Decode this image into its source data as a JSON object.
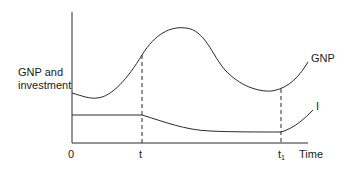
{
  "diagram": {
    "y_axis_label_line1": "GNP and",
    "y_axis_label_line2": "investment",
    "x_axis_label": "Time",
    "x_ticks": {
      "origin": "0",
      "t": "t",
      "t1_base": "t",
      "t1_sub": "1"
    },
    "curves": {
      "gnp_label": "GNP",
      "investment_label": "I"
    },
    "colors": {
      "line": "#2a2a2a",
      "background": "#ffffff"
    }
  }
}
